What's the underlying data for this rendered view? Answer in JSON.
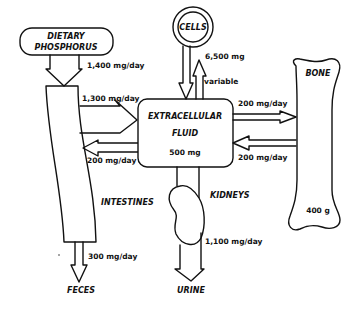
{
  "nodes": {
    "dietary": {
      "line1": "DIETARY",
      "line2": "PHOSPHORUS"
    },
    "cells": {
      "label": "CELLS",
      "amount": "6,500 mg"
    },
    "ecf": {
      "line1": "EXTRACELLULAR",
      "line2": "FLUID",
      "amount": "500 mg"
    },
    "bone": {
      "label": "BONE",
      "amount": "400 g"
    },
    "intestines": {
      "label": "INTESTINES"
    },
    "kidneys": {
      "label": "KIDNEYS"
    },
    "feces": {
      "label": "FECES"
    },
    "urine": {
      "label": "URINE"
    }
  },
  "flows": {
    "diet_to_intestine": "1,400 mg/day",
    "intestine_to_ecf": "1,300 mg/day",
    "ecf_to_intestine": "200 mg/day",
    "cells_exchange": "variable",
    "ecf_to_bone": "200 mg/day",
    "bone_to_ecf": "200 mg/day",
    "intestine_to_feces": "300 mg/day",
    "kidney_to_urine": "1,100 mg/day"
  }
}
